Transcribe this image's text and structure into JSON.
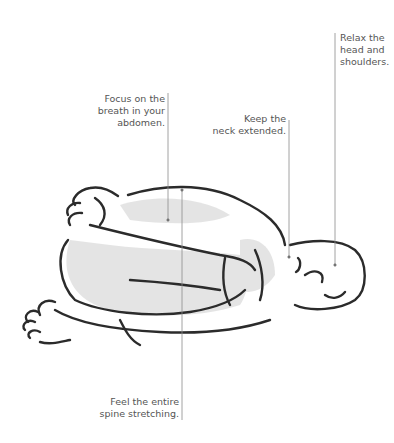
{
  "illustration": {
    "subject": "child's pose / curled forward-bend yoga posture",
    "annotations": [
      {
        "id": "relax",
        "lines": [
          "Relax the",
          "head and",
          "shoulders."
        ]
      },
      {
        "id": "focus",
        "lines": [
          "Focus on the",
          "breath in your",
          "abdomen."
        ]
      },
      {
        "id": "neck",
        "lines": [
          "Keep the",
          "neck extended."
        ]
      },
      {
        "id": "spine",
        "lines": [
          "Feel the entire",
          "spine stretching."
        ]
      }
    ],
    "colors": {
      "line": "#8a8a8a",
      "ink": "#2b2b2b",
      "wash": "#d9d9d9",
      "text": "#555555"
    }
  }
}
